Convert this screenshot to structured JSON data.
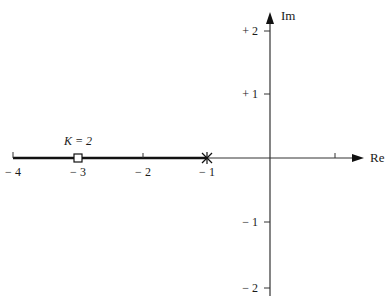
{
  "diagram": {
    "type": "root-locus",
    "axes": {
      "real_label": "Re",
      "imag_label": "Im",
      "real_ticks": [
        {
          "value": -4,
          "label": "− 4"
        },
        {
          "value": -3,
          "label": "− 3"
        },
        {
          "value": -2,
          "label": "− 2"
        },
        {
          "value": -1,
          "label": "− 1"
        },
        {
          "value": 1,
          "label": ""
        }
      ],
      "imag_ticks": [
        {
          "value": 2,
          "label": "+ 2"
        },
        {
          "value": 1,
          "label": "+ 1"
        },
        {
          "value": -1,
          "label": "− 1"
        },
        {
          "value": -2,
          "label": "− 2"
        }
      ]
    },
    "locus_segment": {
      "from": -4,
      "to": -1
    },
    "pole": {
      "re": -1,
      "im": 0,
      "marker": "x"
    },
    "closed_loop_point": {
      "re": -3,
      "im": 0,
      "marker": "square",
      "label": "K = 2"
    }
  },
  "colors": {
    "axis": "#333333",
    "locus": "#111111",
    "text": "#1a1a1a"
  }
}
